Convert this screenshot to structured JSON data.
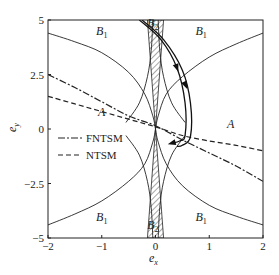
{
  "chart_data": {
    "type": "line",
    "title": "",
    "xlabel": "e",
    "xlabel_sub": "x",
    "ylabel": "e",
    "ylabel_sub": "y",
    "xlim": [
      -2,
      2
    ],
    "ylim": [
      -5,
      5
    ],
    "xticks": [
      -2,
      -1,
      0,
      1,
      2
    ],
    "xtick_labels": [
      "−2",
      "−1",
      "0",
      "1",
      "2"
    ],
    "yticks": [
      5,
      2.5,
      0,
      -2.5,
      -5
    ],
    "ytick_labels": [
      "5",
      "2.5",
      "0",
      "−2.5",
      "−5"
    ],
    "grid": false,
    "legend": {
      "placement": "center-left",
      "entries": [
        {
          "name": "FNTSM",
          "style": "dash-dot"
        },
        {
          "name": "NTSM",
          "style": "dashed"
        }
      ]
    },
    "series": [
      {
        "name": "FNTSM",
        "style": "dash-dot",
        "points": [
          [
            -2,
            2.5
          ],
          [
            -1.5,
            1.9
          ],
          [
            -1,
            1.25
          ],
          [
            -0.5,
            0.6
          ],
          [
            0,
            0.15
          ],
          [
            0.5,
            -0.5
          ],
          [
            1,
            -1.1
          ],
          [
            1.5,
            -1.7
          ],
          [
            2,
            -2.4
          ]
        ]
      },
      {
        "name": "NTSM",
        "style": "dashed",
        "points": [
          [
            -2,
            1.5
          ],
          [
            -1.5,
            1.15
          ],
          [
            -1,
            0.8
          ],
          [
            -0.5,
            0.45
          ],
          [
            0,
            0.1
          ],
          [
            0.5,
            -0.3
          ],
          [
            1,
            -0.55
          ],
          [
            1.5,
            -0.75
          ],
          [
            2,
            -1.0
          ]
        ]
      }
    ],
    "boundaries": [
      {
        "name": "upper-left-boundary",
        "points": [
          [
            -2,
            4.4
          ],
          [
            -1.5,
            4.0
          ],
          [
            -1,
            3.5
          ],
          [
            -0.5,
            2.6
          ],
          [
            -0.2,
            1.6
          ],
          [
            -0.05,
            0.6
          ],
          [
            0,
            0
          ]
        ]
      },
      {
        "name": "upper-right-boundary",
        "points": [
          [
            0,
            0
          ],
          [
            0.05,
            0.6
          ],
          [
            0.2,
            1.6
          ],
          [
            0.5,
            2.4
          ],
          [
            1,
            3.3
          ],
          [
            1.5,
            3.9
          ],
          [
            2,
            4.4
          ]
        ]
      },
      {
        "name": "lower-left-boundary",
        "points": [
          [
            -2,
            -4.4
          ],
          [
            -1.5,
            -3.9
          ],
          [
            -1,
            -3.3
          ],
          [
            -0.5,
            -2.4
          ],
          [
            -0.2,
            -1.6
          ],
          [
            -0.05,
            -0.6
          ],
          [
            0,
            0
          ]
        ]
      },
      {
        "name": "lower-right-boundary",
        "points": [
          [
            0,
            0
          ],
          [
            0.05,
            -0.6
          ],
          [
            0.2,
            -1.6
          ],
          [
            0.5,
            -2.6
          ],
          [
            1,
            -3.5
          ],
          [
            1.5,
            -4.0
          ],
          [
            2,
            -4.4
          ]
        ]
      },
      {
        "name": "inner-left-cusp",
        "points": [
          [
            -0.55,
            0.3
          ],
          [
            -0.3,
            1.2
          ],
          [
            -0.15,
            2.4
          ],
          [
            -0.08,
            3.6
          ],
          [
            -0.05,
            5
          ]
        ]
      },
      {
        "name": "inner-right-cusp",
        "points": [
          [
            0.55,
            0.3
          ],
          [
            0.3,
            1.2
          ],
          [
            0.15,
            2.4
          ],
          [
            0.08,
            3.6
          ],
          [
            0.05,
            5
          ]
        ]
      },
      {
        "name": "inner-left-cusp-lower",
        "points": [
          [
            -0.55,
            -0.3
          ],
          [
            -0.3,
            -1.2
          ],
          [
            -0.15,
            -2.4
          ],
          [
            -0.08,
            -3.6
          ],
          [
            -0.05,
            -5
          ]
        ]
      },
      {
        "name": "inner-right-cusp-lower",
        "points": [
          [
            0.55,
            -0.3
          ],
          [
            0.3,
            -1.2
          ],
          [
            0.15,
            -2.4
          ],
          [
            0.08,
            -3.6
          ],
          [
            0.05,
            -5
          ]
        ]
      }
    ],
    "hatched_regions": [
      {
        "name": "B2-top",
        "points": [
          [
            -0.15,
            5
          ],
          [
            0.15,
            5
          ],
          [
            0,
            0
          ]
        ]
      },
      {
        "name": "B2-bottom",
        "points": [
          [
            -0.15,
            -5
          ],
          [
            0.15,
            -5
          ],
          [
            0,
            0
          ]
        ]
      }
    ],
    "trajectories": [
      {
        "name": "trajectory-1",
        "points": [
          [
            -0.3,
            5
          ],
          [
            0.1,
            4.1
          ],
          [
            0.4,
            2.8
          ],
          [
            0.55,
            1.2
          ],
          [
            0.55,
            -0.3
          ],
          [
            0.45,
            -0.55
          ],
          [
            0.3,
            -0.65
          ]
        ]
      },
      {
        "name": "trajectory-2",
        "points": [
          [
            -0.25,
            5
          ],
          [
            0.15,
            4.1
          ],
          [
            0.5,
            2.7
          ],
          [
            0.65,
            1.2
          ],
          [
            0.65,
            -0.35
          ],
          [
            0.5,
            -0.75
          ],
          [
            0.4,
            -0.8
          ]
        ]
      }
    ],
    "arrows": [
      {
        "on": "trajectory-1",
        "at": [
          0.4,
          2.8
        ]
      },
      {
        "on": "trajectory-2",
        "at": [
          0.56,
          2.0
        ]
      },
      {
        "on": "trajectory-1",
        "at": [
          0.3,
          -0.65
        ]
      }
    ],
    "region_labels": [
      {
        "text": "A",
        "x": -1,
        "y": 0.6
      },
      {
        "text": "A",
        "x": 1.4,
        "y": 0.05
      },
      {
        "text": "B",
        "sub": "1",
        "x": -1,
        "y": 4.3
      },
      {
        "text": "B",
        "sub": "1",
        "x": 0.85,
        "y": 4.3
      },
      {
        "text": "B",
        "sub": "1",
        "x": -1,
        "y": -4.2
      },
      {
        "text": "B",
        "sub": "1",
        "x": 0.85,
        "y": -4.2
      },
      {
        "text": "B",
        "sub": "2",
        "x": -0.05,
        "y": 4.7
      },
      {
        "text": "B",
        "sub": "2",
        "x": -0.05,
        "y": -4.6
      }
    ]
  }
}
